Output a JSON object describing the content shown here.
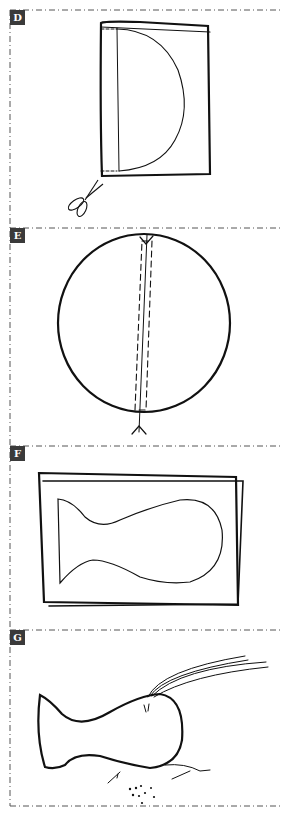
{
  "figure": {
    "border_style": "dash-dot",
    "colors": {
      "line": "#111111",
      "label_bg": "#3a3a3a",
      "label_text": "#ffffff",
      "border": "#555555"
    },
    "panels": [
      {
        "label": "D",
        "description": "Folded fabric rectangle with half-circle pattern traced along fold; scissors below"
      },
      {
        "label": "E",
        "description": "Circle cut out, with slit opening marked by dashed lines and notches at top and bottom"
      },
      {
        "label": "F",
        "description": "Folded fabric rectangle with fish/bottle shape outline"
      },
      {
        "label": "G",
        "description": "Fish shape with strands of thread at top and stitching with stuffing at bottom"
      }
    ]
  }
}
